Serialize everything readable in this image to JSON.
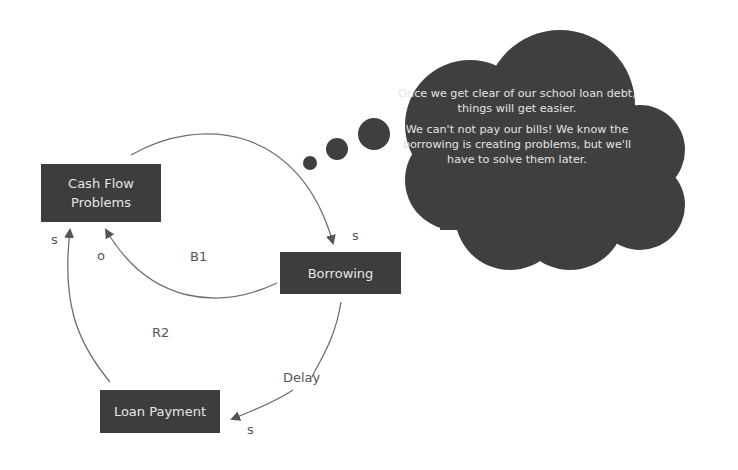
{
  "diagram": {
    "type": "causal-loop-diagram",
    "colors": {
      "node_fill": "#3d3d3d",
      "node_text": "#e6e6e6",
      "arrow": "#6e6e6e",
      "label_text": "#555555",
      "cloud_fill": "#3f3f3f",
      "background": "#ffffff"
    },
    "nodes": [
      {
        "id": "cash_flow",
        "label_line1": "Cash Flow",
        "label_line2": "Problems"
      },
      {
        "id": "borrowing",
        "label": "Borrowing"
      },
      {
        "id": "loan_payment",
        "label": "Loan Payment"
      }
    ],
    "links": [
      {
        "from": "cash_flow",
        "to": "borrowing",
        "polarity": "s"
      },
      {
        "from": "borrowing",
        "to": "cash_flow",
        "polarity": "o"
      },
      {
        "from": "borrowing",
        "to": "loan_payment",
        "polarity": "s",
        "annotation": "Delay"
      },
      {
        "from": "loan_payment",
        "to": "cash_flow",
        "polarity": "s"
      }
    ],
    "loops": [
      {
        "id": "B1",
        "label": "B1"
      },
      {
        "id": "R2",
        "label": "R2"
      }
    ],
    "polarity_labels": {
      "cash_to_borrowing": "s",
      "borrowing_to_cash": "o",
      "loan_to_cash": "s",
      "borrowing_to_loan": "s"
    },
    "delay_label": "Delay",
    "thought_bubble": {
      "paragraph1": "Once we get clear of our school loan debt, things will get easier.",
      "paragraph2": "We can't not pay our bills! We know the borrowing is creating problems, but we'll have to solve them later."
    }
  }
}
